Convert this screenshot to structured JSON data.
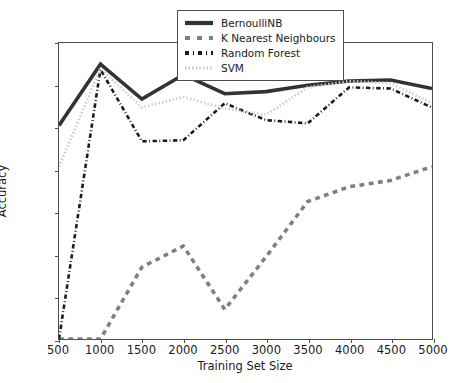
{
  "chart_data": {
    "type": "line",
    "title": "",
    "xlabel": "Training Set Size",
    "ylabel": "Accuracy",
    "x": [
      500,
      1000,
      1500,
      2000,
      2500,
      3000,
      3500,
      4000,
      4500,
      5000
    ],
    "xlim": [
      500,
      5000
    ],
    "ylim": [
      86,
      100
    ],
    "xticks": [
      500,
      1000,
      1500,
      2000,
      2500,
      3000,
      3500,
      4000,
      4500,
      5000
    ],
    "yticks": [
      86,
      88,
      90,
      92,
      94,
      96,
      98,
      100
    ],
    "grid": false,
    "legend_position": "upper center",
    "series": [
      {
        "name": "BernoulliNB",
        "style": "solid",
        "color": "#333333",
        "width": 3.6,
        "values": [
          96.1,
          99.0,
          97.35,
          98.5,
          97.6,
          97.7,
          98.0,
          98.2,
          98.25,
          97.85
        ]
      },
      {
        "name": "K Nearest Neighbours",
        "style": "dashed",
        "color": "#808080",
        "width": 3.6,
        "values": [
          86.0,
          86.0,
          89.4,
          90.4,
          87.4,
          89.9,
          92.5,
          93.2,
          93.5,
          94.15
        ]
      },
      {
        "name": "Random Forest",
        "style": "dashdot",
        "color": "#1a1a1a",
        "width": 2.6,
        "values": [
          86.0,
          98.75,
          95.35,
          95.4,
          97.15,
          96.35,
          96.2,
          97.9,
          97.85,
          96.95
        ]
      },
      {
        "name": "SVM",
        "style": "dotted",
        "color": "#cccccc",
        "width": 2.8,
        "values": [
          94.15,
          98.8,
          96.95,
          97.45,
          96.9,
          96.6,
          97.9,
          98.2,
          98.1,
          97.15
        ]
      }
    ]
  },
  "axes": {
    "x_tick_labels": [
      "500",
      "1000",
      "1500",
      "2000",
      "2500",
      "3000",
      "3500",
      "4000",
      "4500",
      "5000"
    ],
    "y_tick_labels": [
      "86",
      "88",
      "90",
      "92",
      "94",
      "96",
      "98",
      "100"
    ]
  },
  "legend": {
    "entries": [
      {
        "label": "BernoulliNB"
      },
      {
        "label": "K Nearest Neighbours"
      },
      {
        "label": "Random Forest"
      },
      {
        "label": "SVM"
      }
    ]
  }
}
